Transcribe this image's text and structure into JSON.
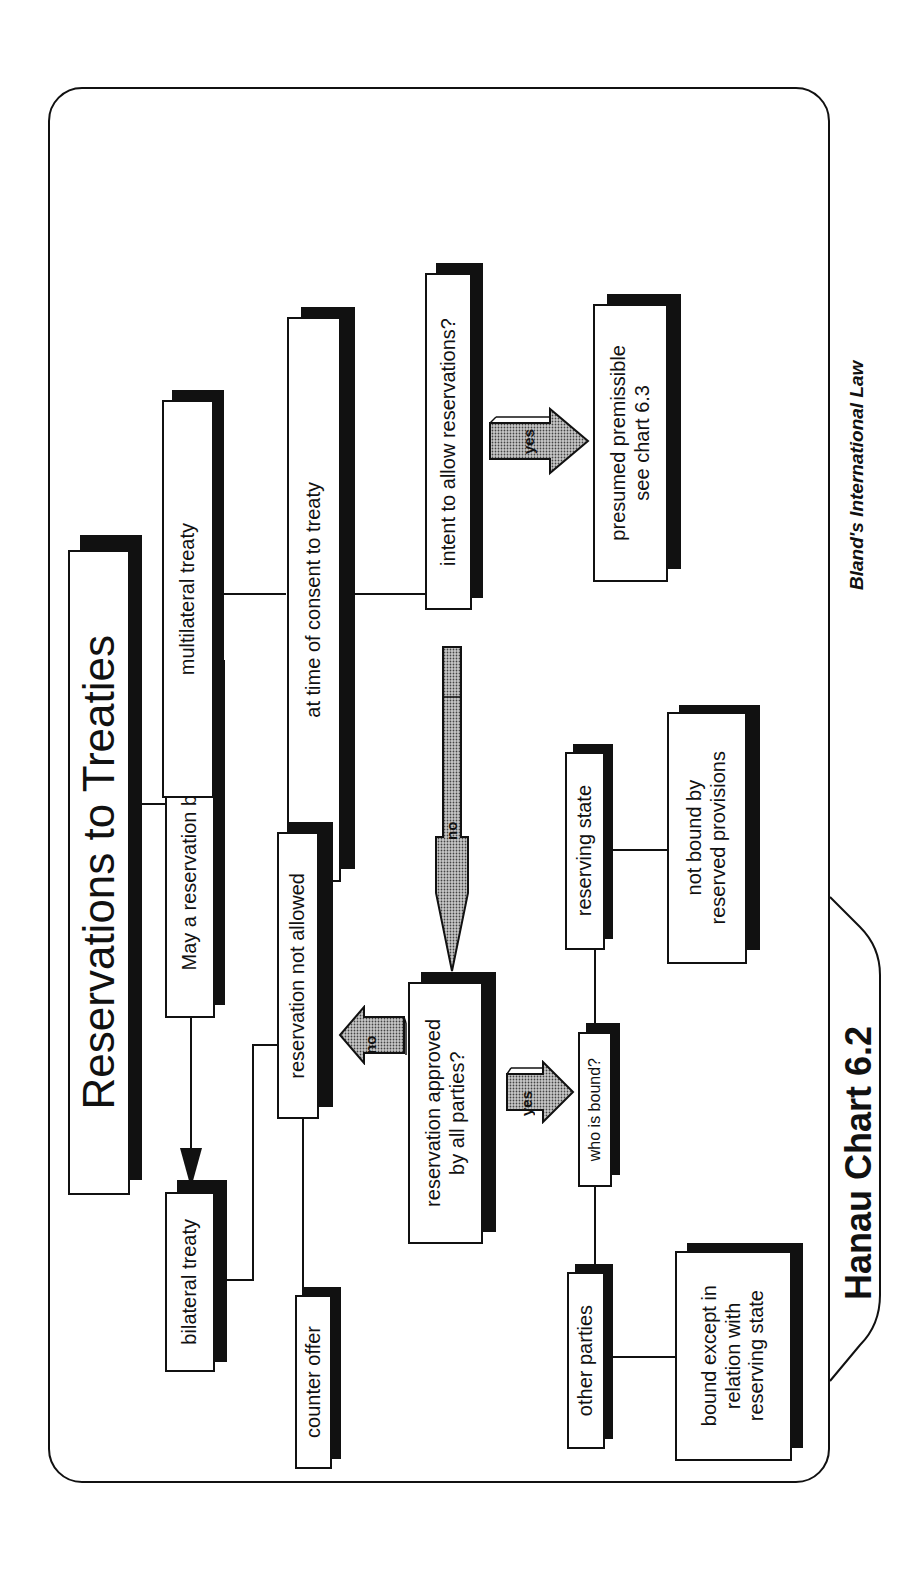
{
  "chart": {
    "title": "Reservations to Treaties",
    "tab_label": "Hanau Chart 6.2",
    "credit": "Bland's International Law",
    "orientation": "rotated 90° counter-clockwise (text reads bottom-to-top)"
  },
  "nodes": {
    "root": "May a reservation be made?",
    "bilateral": "bilateral treaty",
    "multilateral": "multilateral treaty",
    "not_allowed": "reservation not allowed",
    "counter_offer": "counter offer",
    "time_of_consent": "at time of consent to treaty",
    "intent": "intent to allow reservations?",
    "presumed": "presumed premissible\nsee chart 6.3",
    "approved": "reservation approved\nby all parties?",
    "who_bound": "who is bound?",
    "reserving_state": "reserving state",
    "other_parties": "other parties",
    "not_bound": "not bound by\nreserved provisions",
    "bound_except": "bound except in\nrelation with\nreserving state"
  },
  "arrows": {
    "intent_yes": "yes",
    "intent_no": "no",
    "approved_yes": "yes",
    "approved_no": "no"
  },
  "edges": [
    {
      "from": "root",
      "to": "multilateral",
      "style": "arrow"
    },
    {
      "from": "root",
      "to": "bilateral",
      "style": "arrow"
    },
    {
      "from": "root",
      "to": "title",
      "style": "line"
    },
    {
      "from": "multilateral",
      "to": "time_of_consent",
      "style": "line"
    },
    {
      "from": "time_of_consent",
      "to": "intent",
      "style": "line"
    },
    {
      "from": "intent",
      "to": "presumed",
      "style": "block-arrow",
      "label": "yes"
    },
    {
      "from": "intent",
      "to": "approved",
      "style": "block-arrow",
      "label": "no"
    },
    {
      "from": "approved",
      "to": "not_allowed",
      "style": "block-arrow",
      "label": "no"
    },
    {
      "from": "approved",
      "to": "who_bound",
      "style": "block-arrow",
      "label": "yes"
    },
    {
      "from": "bilateral",
      "to": "not_allowed",
      "style": "elbow-line"
    },
    {
      "from": "not_allowed",
      "to": "counter_offer",
      "style": "line"
    },
    {
      "from": "who_bound",
      "to": "reserving_state",
      "style": "line"
    },
    {
      "from": "who_bound",
      "to": "other_parties",
      "style": "line"
    },
    {
      "from": "reserving_state",
      "to": "not_bound",
      "style": "line"
    },
    {
      "from": "other_parties",
      "to": "bound_except",
      "style": "line"
    }
  ],
  "colors": {
    "ink": "#111111",
    "paper": "#ffffff",
    "arrow_fill": "#bdbdbd"
  }
}
